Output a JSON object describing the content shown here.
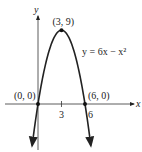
{
  "chart_data": {
    "type": "line",
    "title": "",
    "xlabel": "x",
    "ylabel": "y",
    "equation_label": "y = 6x − x²",
    "equation": {
      "a": -1,
      "b": 6,
      "c": 0
    },
    "xlim": [
      -0.75,
      6.75
    ],
    "ylim": [
      -5.5,
      9
    ],
    "x_ticks": [
      {
        "value": 3,
        "label": "3"
      },
      {
        "value": 6,
        "label": "6"
      }
    ],
    "points": [
      {
        "x": 0,
        "y": 0,
        "label": "(0, 0)"
      },
      {
        "x": 3,
        "y": 9,
        "label": "(3, 9)"
      },
      {
        "x": 6,
        "y": 0,
        "label": "(6, 0)"
      }
    ],
    "grid": false,
    "color": "#222222"
  }
}
